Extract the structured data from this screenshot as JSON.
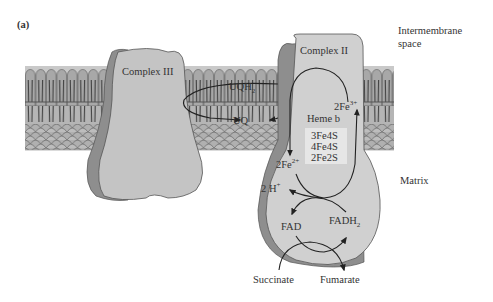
{
  "figure": {
    "panel_label": "(a)",
    "regions": {
      "intermembrane": [
        "Intermembrane",
        "space"
      ],
      "matrix": "Matrix"
    },
    "complexes": {
      "complex3": "Complex III",
      "complex2": "Complex II"
    },
    "quinone": {
      "reduced": "UQH",
      "reduced_sub": "2",
      "oxidized": "UQ"
    },
    "iron": {
      "ferric": "2Fe",
      "ferric_sup": "3+",
      "ferrous": "2Fe",
      "ferrous_sup": "2+"
    },
    "heme": "Heme b",
    "clusters": [
      "3Fe4S",
      "4Fe4S",
      "2Fe2S"
    ],
    "protons": {
      "text": "2 H",
      "sup": "+"
    },
    "flavin": {
      "fad": "FAD",
      "fadh": "FADH",
      "fadh_sub": "2"
    },
    "substrates": {
      "succinate": "Succinate",
      "fumarate": "Fumarate"
    },
    "colors": {
      "membrane_fill": "#b5b5b5",
      "membrane_dark": "#555555",
      "protein_light": "#c8c8c8",
      "protein_shadow": "#8e8e8e",
      "protein_inner": "#d9d9d9",
      "text": "#333333",
      "arrow": "#222222"
    }
  }
}
